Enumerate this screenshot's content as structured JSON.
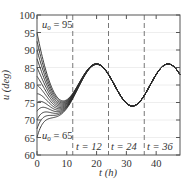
{
  "chart_data": {
    "type": "line",
    "title": "",
    "xlabel": "t (h)",
    "ylabel": "u (deg)",
    "xlim": [
      0,
      48
    ],
    "ylim": [
      60,
      100
    ],
    "xticks": [
      0,
      10,
      20,
      30,
      40
    ],
    "yticks": [
      60,
      65,
      70,
      75,
      80,
      85,
      90,
      95,
      100
    ],
    "grid": true,
    "legend": null,
    "initial_values": [
      65,
      67.5,
      70,
      72.5,
      75,
      77.5,
      80,
      82.5,
      85,
      87.5,
      90,
      92.5,
      95
    ],
    "decay_rate_k": 0.25,
    "steady_state": {
      "t": [
        0,
        2,
        4,
        6,
        8,
        10,
        12,
        14,
        16,
        18,
        20,
        22,
        24,
        26,
        28,
        30,
        32,
        34,
        36,
        38,
        40,
        42,
        44,
        46,
        48
      ],
      "u": [
        83,
        80,
        77,
        74.8,
        74,
        74.8,
        77,
        80,
        83,
        85.2,
        86,
        85.2,
        83,
        80,
        77,
        74.8,
        74,
        74.8,
        77,
        80,
        83,
        85.2,
        86,
        85.2,
        83
      ]
    },
    "dashed_lines": [
      {
        "t": 12,
        "label": "t = 12"
      },
      {
        "t": 24,
        "label": "t = 24"
      },
      {
        "t": 36,
        "label": "t = 36"
      }
    ],
    "annotations": [
      {
        "text": "u0 = 95",
        "t": 1.5,
        "u": 92
      },
      {
        "text": "u0 = 65",
        "t": 1.5,
        "u": 64
      }
    ],
    "colors": {
      "curves": "#2b2b2b",
      "dashed": "#777777",
      "axis": "#555555",
      "grid": "#eeeeee"
    }
  },
  "labels": {
    "x_axis": "t (h)",
    "y_axis": "u (deg)",
    "u0_top_main": "u",
    "u0_top_sub": "0",
    "u0_top_rest": " = 95",
    "u0_bot_main": "u",
    "u0_bot_sub": "0",
    "u0_bot_rest": " = 65",
    "dash1": "t = 12",
    "dash2": "t = 24",
    "dash3": "t = 36"
  }
}
